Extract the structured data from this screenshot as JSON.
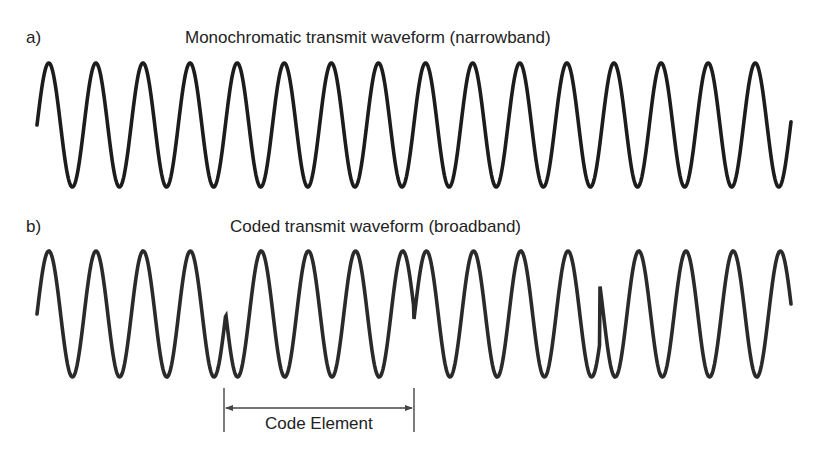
{
  "panels": [
    {
      "id": "a",
      "label": "a)",
      "title": "Monochromatic transmit waveform (narrowband)",
      "waveform": {
        "type": "narrowband",
        "x_start": 37,
        "x_end": 791,
        "center_y": 125,
        "amplitude": 62,
        "period": 47.1,
        "phase_flips": []
      }
    },
    {
      "id": "b",
      "label": "b)",
      "title": "Coded transmit waveform (broadband)",
      "waveform": {
        "type": "broadband-phase-coded",
        "x_start": 37,
        "x_end": 791,
        "center_y": 314,
        "amplitude": 63,
        "period": 47.2,
        "cycles_per_code_element": 4,
        "code": [
          1,
          -1,
          1,
          -1
        ],
        "phase_flips": [
          226,
          414,
          600
        ]
      }
    }
  ],
  "annotation": {
    "label": "Code Element",
    "x_left": 224,
    "x_right": 414,
    "arrow_y": 408,
    "tick_top": 388,
    "tick_bottom": 432
  },
  "colors": {
    "waveform_a": "#1c1c1c",
    "waveform_b": "#2a2a2a",
    "annotation": "#444444"
  }
}
